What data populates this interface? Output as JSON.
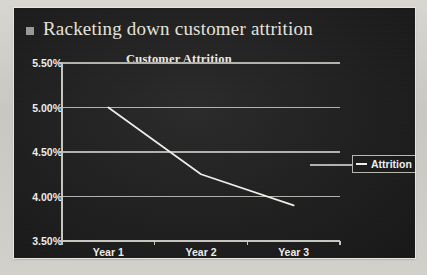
{
  "slide": {
    "title": "Racketing down customer attrition",
    "bullet_glyph": "square-bullet"
  },
  "legend": {
    "label": "Attrition",
    "position": "right"
  },
  "colors": {
    "slide_background": "#1f1f1f",
    "page_background": "#d2d0cb",
    "text": "#efeee9",
    "series_line": "#efeee9",
    "gridline": "#b4b2ac",
    "axis": "#c8c6c0",
    "bullet": "#9b9b95"
  },
  "chart_data": {
    "type": "line",
    "title": "Customer Attrition",
    "xlabel": "",
    "ylabel": "",
    "categories": [
      "Year 1",
      "Year 2",
      "Year 3"
    ],
    "series": [
      {
        "name": "Attrition",
        "values": [
          5.0,
          4.25,
          3.9
        ]
      }
    ],
    "ylim": [
      3.5,
      5.5
    ],
    "yticks": [
      5.5,
      5.0,
      4.5,
      4.0,
      3.5
    ],
    "ytick_labels": [
      "5.50%",
      "5.00%",
      "4.50%",
      "4.00%",
      "3.50%"
    ],
    "value_format": "percent",
    "grid": true,
    "legend_position": "right"
  }
}
